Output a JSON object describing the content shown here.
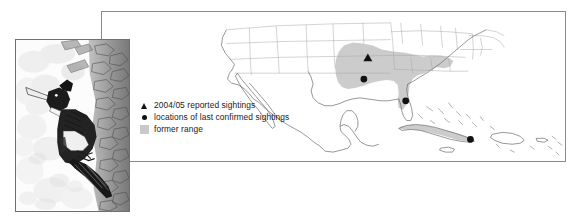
{
  "figure": {
    "background_color": "#ffffff"
  },
  "map_panel": {
    "name": "North America and Caribbean map",
    "border_color": "#8a8a8a",
    "fill_color": "#ffffff",
    "coastline_color": "#5a5a5a",
    "state_border_color": "#9a9a9a",
    "former_range_color": "#c9c9c9",
    "marker_color": "#111111",
    "regions": [
      "United States",
      "Mexico",
      "Cuba",
      "Hispaniola",
      "Jamaica",
      "Bahamas"
    ]
  },
  "legend": {
    "items": [
      {
        "marker": "triangle-marker-icon",
        "label": "2004/05 reported sightings",
        "color": "#111111"
      },
      {
        "marker": "dot-marker-icon",
        "label": "locations of last confirmed sightings",
        "color": "#111111"
      },
      {
        "marker": "range-swatch-icon",
        "label": "former range",
        "color": "#c9c9c9"
      }
    ]
  },
  "map_markers": {
    "reported_sightings": [
      {
        "label": "2004/05 reported sighting",
        "region": "Arkansas",
        "x": 267,
        "y": 47
      }
    ],
    "confirmed_sightings": [
      {
        "label": "last confirmed sighting",
        "region": "Louisiana",
        "x": 263,
        "y": 68
      },
      {
        "label": "last confirmed sighting",
        "region": "Florida",
        "x": 305,
        "y": 90
      },
      {
        "label": "last confirmed sighting",
        "region": "Cuba",
        "x": 370,
        "y": 125
      }
    ]
  },
  "bird_panel": {
    "name": "Ivory-billed Woodpecker illustration",
    "subject": "Ivory-billed Woodpecker perched on tree trunk",
    "border_color": "#6f6f6f",
    "background_color": "#fdfdfd"
  }
}
